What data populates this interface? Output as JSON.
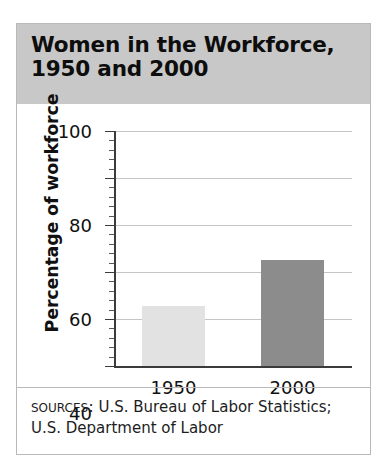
{
  "panel": {
    "title": "Women in the Workforce,\n1950 and 2000",
    "sources_label": "Sources:",
    "sources_text": " U.S. Bureau of Labor Statistics; U.S. Department of Labor"
  },
  "chart_data": {
    "type": "bar",
    "title": "Women in the Workforce, 1950 and 2000",
    "categories": [
      "1950",
      "2000"
    ],
    "values": [
      25.5,
      45
    ],
    "series": [
      {
        "name": "Percentage of workforce",
        "values": [
          25.5,
          45
        ]
      }
    ],
    "xlabel": "",
    "ylabel": "Percentage of workforce",
    "ylim": [
      0,
      100
    ],
    "y_ticks": [
      "0",
      "20",
      "40",
      "60",
      "80",
      "100"
    ],
    "y_tick_values": [
      0,
      20,
      40,
      60,
      80,
      100
    ],
    "minor_ticks_between": 4,
    "grid": true,
    "legend": false,
    "bar_colors": [
      "#e2e2e2",
      "#8c8c8c"
    ],
    "axis_color": "#3b3b3b",
    "grid_color": "#c4c4c4",
    "header_color": "#c8c8c8",
    "bars": [
      {
        "category": "1950",
        "value": 25.5,
        "color": "#e2e2e2"
      },
      {
        "category": "2000",
        "value": 45,
        "color": "#8c8c8c"
      }
    ]
  }
}
